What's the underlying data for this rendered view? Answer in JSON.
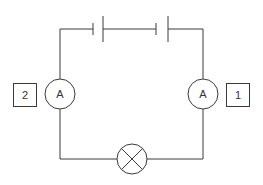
{
  "diagram": {
    "type": "circuit",
    "components": {
      "battery": {
        "cells": 2,
        "label": ""
      },
      "ammeter_left": {
        "symbol": "A",
        "label_box": "2"
      },
      "ammeter_right": {
        "symbol": "A",
        "label_box": "1"
      },
      "lamp": {
        "symbol": "lamp-cross"
      }
    },
    "colors": {
      "line": "#3a3a3a",
      "background": "#ffffff",
      "text": "#333333"
    }
  }
}
